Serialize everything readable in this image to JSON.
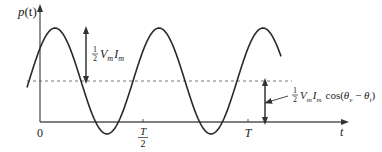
{
  "diagram": {
    "y_axis_label": {
      "main": "p",
      "paren": "(t)"
    },
    "x_axis_label": "t",
    "ticks": [
      {
        "label": "0"
      },
      {
        "label_num": "T",
        "label_den": "2"
      },
      {
        "label": "T"
      }
    ],
    "annotation_amplitude": {
      "frac_num": "1",
      "frac_den": "2",
      "V": "V",
      "V_sub": "m",
      "I": "I",
      "I_sub": "m"
    },
    "annotation_average": {
      "frac_num": "1",
      "frac_den": "2",
      "V": "V",
      "V_sub": "m",
      "I": "I",
      "I_sub": "m",
      "cos": "cos(",
      "theta_v": "θ",
      "v_sub": "v",
      "minus": " − ",
      "theta_i": "θ",
      "i_sub": "i",
      "close": ")"
    },
    "colors": {
      "curve": "#2a2a2a",
      "axis": "#555555",
      "dashed": "#777777"
    }
  }
}
